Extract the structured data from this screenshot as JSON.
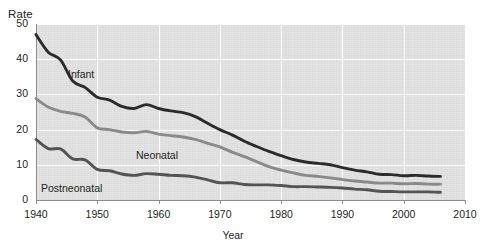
{
  "chart_data": {
    "type": "line",
    "title": "",
    "xlabel": "Year",
    "ylabel": "Rate",
    "xlim": [
      1940,
      2010
    ],
    "ylim": [
      0,
      50
    ],
    "xticks": [
      1940,
      1950,
      1960,
      1970,
      1980,
      1990,
      2000,
      2010
    ],
    "yticks": [
      0,
      10,
      20,
      30,
      40,
      50
    ],
    "grid": true,
    "legend_position": "inline-annotations",
    "series": [
      {
        "name": "Infant",
        "color": "#2b2b2b",
        "x": [
          1940,
          1942,
          1944,
          1946,
          1948,
          1950,
          1952,
          1954,
          1956,
          1958,
          1960,
          1962,
          1964,
          1966,
          1968,
          1970,
          1972,
          1974,
          1976,
          1978,
          1980,
          1982,
          1984,
          1986,
          1988,
          1990,
          1992,
          1994,
          1996,
          1998,
          2000,
          2002,
          2004,
          2006
        ],
        "values": [
          47.0,
          42.0,
          39.8,
          33.8,
          32.0,
          29.2,
          28.4,
          26.6,
          26.0,
          27.1,
          26.0,
          25.3,
          24.8,
          23.7,
          21.8,
          20.0,
          18.5,
          16.7,
          15.2,
          13.8,
          12.6,
          11.5,
          10.8,
          10.4,
          10.0,
          9.2,
          8.5,
          8.0,
          7.3,
          7.2,
          6.9,
          7.0,
          6.8,
          6.7
        ]
      },
      {
        "name": "Neonatal",
        "color": "#8a8a8a",
        "x": [
          1940,
          1942,
          1944,
          1946,
          1948,
          1950,
          1952,
          1954,
          1956,
          1958,
          1960,
          1962,
          1964,
          1966,
          1968,
          1970,
          1972,
          1974,
          1976,
          1978,
          1980,
          1982,
          1984,
          1986,
          1988,
          1990,
          1992,
          1994,
          1996,
          1998,
          2000,
          2002,
          2004,
          2006
        ],
        "values": [
          28.8,
          26.4,
          25.2,
          24.6,
          23.6,
          20.5,
          20.0,
          19.3,
          19.1,
          19.5,
          18.7,
          18.3,
          17.9,
          17.2,
          16.1,
          15.1,
          13.6,
          12.3,
          10.9,
          9.5,
          8.5,
          7.7,
          7.0,
          6.7,
          6.3,
          5.8,
          5.4,
          5.1,
          4.8,
          4.8,
          4.6,
          4.7,
          4.5,
          4.5
        ]
      },
      {
        "name": "Postneonatal",
        "color": "#545454",
        "x": [
          1940,
          1942,
          1944,
          1946,
          1948,
          1950,
          1952,
          1954,
          1956,
          1958,
          1960,
          1962,
          1964,
          1966,
          1968,
          1970,
          1972,
          1974,
          1976,
          1978,
          1980,
          1982,
          1984,
          1986,
          1988,
          1990,
          1992,
          1994,
          1996,
          1998,
          2000,
          2002,
          2004,
          2006
        ],
        "values": [
          17.2,
          14.6,
          14.5,
          11.7,
          11.4,
          8.7,
          8.3,
          7.4,
          7.0,
          7.5,
          7.3,
          7.0,
          6.9,
          6.5,
          5.7,
          4.9,
          4.9,
          4.4,
          4.3,
          4.3,
          4.1,
          3.8,
          3.8,
          3.7,
          3.6,
          3.4,
          3.1,
          2.9,
          2.5,
          2.4,
          2.3,
          2.3,
          2.3,
          2.2
        ]
      }
    ],
    "annotations": [
      {
        "text": "Infant",
        "x_px": 68,
        "y_px": 68
      },
      {
        "text": "Neonatal",
        "x_px": 136,
        "y_px": 149
      },
      {
        "text": "Postneonatal",
        "x_px": 41,
        "y_px": 182
      }
    ]
  },
  "axes": {
    "y_title": "Rate",
    "x_title": "Year",
    "y_tick_labels": [
      "50",
      "40",
      "30",
      "20",
      "10",
      "0"
    ],
    "x_tick_labels": [
      "1940",
      "1950",
      "1960",
      "1970",
      "1980",
      "1990",
      "2000",
      "2010"
    ]
  },
  "colors": {
    "plot_background": "#e3e3e3",
    "gridline": "#ffffff",
    "axis": "#8c8c8c",
    "text": "#231f20"
  }
}
